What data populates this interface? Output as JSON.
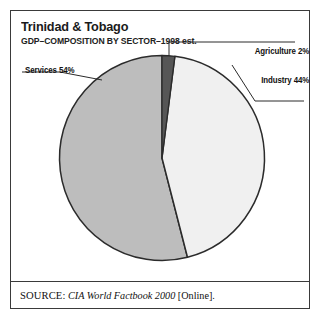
{
  "figure": {
    "title": "Trinidad & Tobago",
    "subtitle": "GDP–COMPOSITION BY SECTOR–1998 est.",
    "source_kicker": "SOURCE:",
    "source_title": "CIA World Factbook 2000",
    "source_suffix": "[Online].",
    "frame_color": "#3a3a3a",
    "background": "#ffffff"
  },
  "labels": {
    "services": "Services 54%",
    "agriculture": "Agriculture 2%",
    "industry": "Industry 44%"
  },
  "chart_data": {
    "type": "pie",
    "title": "Trinidad & Tobago",
    "subtitle": "GDP–COMPOSITION BY SECTOR–1998 est.",
    "xlabel": "",
    "ylabel": "",
    "unit": "percent",
    "total": 100,
    "start_angle_deg": 0,
    "direction": "clockwise",
    "legend": "none-inline-callouts",
    "grid": false,
    "categories": [
      "Agriculture",
      "Industry",
      "Services"
    ],
    "values": [
      2,
      44,
      54
    ],
    "slices": [
      {
        "name": "Agriculture",
        "value": 2,
        "label": "Agriculture 2%",
        "color": "#565656",
        "start_deg": 0,
        "end_deg": 7.2
      },
      {
        "name": "Industry",
        "value": 44,
        "label": "Industry 44%",
        "color": "#f0f0f0",
        "start_deg": 7.2,
        "end_deg": 165.6
      },
      {
        "name": "Services",
        "value": 54,
        "label": "Services 54%",
        "color": "#bdbdbd",
        "start_deg": 165.6,
        "end_deg": 360
      }
    ],
    "outline_color": "#2b2b2b",
    "annotations": [
      {
        "text": "Agriculture 2%",
        "leader": true,
        "side": "top-right"
      },
      {
        "text": "Industry 44%",
        "leader": true,
        "side": "right"
      },
      {
        "text": "Services 54%",
        "leader": true,
        "side": "left"
      }
    ]
  }
}
